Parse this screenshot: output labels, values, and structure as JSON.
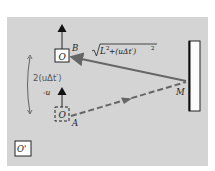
{
  "diagram": {
    "colors": {
      "background": "#d4d4d4",
      "box_fill": "#ffffff",
      "stroke": "#222222",
      "ray": "#666666",
      "handwriting": "#555555"
    },
    "observer_top": {
      "label": "O",
      "point_label": "B"
    },
    "observer_bottom": {
      "label": "O",
      "point_label": "A",
      "velocity_label": "-u",
      "style": "dashed"
    },
    "mirror": {
      "label": "M"
    },
    "frame": {
      "label": "O'"
    },
    "return_path": {
      "label_radical": "√",
      "label_L": "L",
      "label_sup1": "2",
      "label_mid": " +(uΔt′)",
      "label_sup2": "2",
      "style": "solid"
    },
    "outgoing_path": {
      "style": "dashed"
    },
    "annotation": {
      "text": "2(uΔt′)",
      "style": "handwritten"
    },
    "icons": [
      "up-arrow-icon",
      "up-arrow-icon",
      "double-headed-arrow-icon"
    ]
  }
}
